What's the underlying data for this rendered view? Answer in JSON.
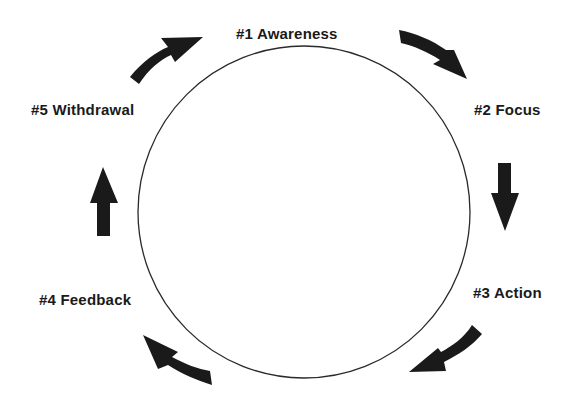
{
  "diagram": {
    "type": "cycle",
    "colors": {
      "background": "#ffffff",
      "ink": "#1a1a1a",
      "circle_stroke": "#2a2a2a"
    },
    "circle": {
      "cx": 304,
      "cy": 212,
      "r": 166
    },
    "stages": [
      {
        "id": 1,
        "label": "#1 Awareness",
        "x": 236,
        "y": 26
      },
      {
        "id": 2,
        "label": "#2 Focus",
        "x": 474,
        "y": 102
      },
      {
        "id": 3,
        "label": "#3 Action",
        "x": 473,
        "y": 285
      },
      {
        "id": 4,
        "label": "#4 Feedback",
        "x": 39,
        "y": 292
      },
      {
        "id": 5,
        "label": "#5 Withdrawal",
        "x": 31,
        "y": 102
      }
    ],
    "arrows": [
      {
        "name": "arrow-withdrawal-to-awareness",
        "direction": "up-right curved"
      },
      {
        "name": "arrow-awareness-to-focus",
        "direction": "down-right curved"
      },
      {
        "name": "arrow-focus-to-action",
        "direction": "down"
      },
      {
        "name": "arrow-action-to-feedback",
        "direction": "down-left curved"
      },
      {
        "name": "arrow-feedback-to-withdrawal-lower",
        "direction": "up-left curved"
      },
      {
        "name": "arrow-feedback-to-withdrawal",
        "direction": "up"
      }
    ]
  }
}
